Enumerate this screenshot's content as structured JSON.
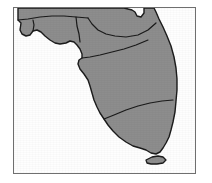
{
  "figure": {
    "background_color": "#ffffff",
    "frame": {
      "border_color": "#6f6f6f",
      "border_width_px": 1,
      "x": 13,
      "y": 7,
      "width": 183,
      "height": 167
    }
  },
  "map": {
    "land_fill_color": "#8d8d8d",
    "water_fill_color": "#ffffff",
    "outline_color": "#1a1a1a",
    "internal_border_color": "#1a1a1a",
    "outline_width_px": 1.4,
    "internal_border_width_px": 1.2,
    "regions": [
      {
        "id": "western-panhandle",
        "label": "Western Panhandle"
      },
      {
        "id": "central-panhandle",
        "label": "Central Panhandle"
      },
      {
        "id": "eastern-panhandle",
        "label": "Eastern Panhandle"
      },
      {
        "id": "north-central",
        "label": "North Central"
      },
      {
        "id": "northeast",
        "label": "Northeast"
      },
      {
        "id": "central-peninsula",
        "label": "Central Peninsula"
      },
      {
        "id": "south-peninsula",
        "label": "South Peninsula"
      },
      {
        "id": "southeast-tip",
        "label": "Southeast Tip"
      }
    ],
    "features": [
      {
        "id": "mainland",
        "label": "Florida mainland"
      },
      {
        "id": "florida-keys",
        "label": "Florida Keys"
      }
    ]
  },
  "chart_data": {
    "type": "map",
    "projection": "unspecified",
    "xlabel": "",
    "ylabel": "",
    "legend": [],
    "annotations": [],
    "shapes": [
      {
        "name": "mainland",
        "fill": "#8d8d8d",
        "stroke": "#1a1a1a",
        "path": "M 18,8 L 18,20 L 21,23 L 20,30 L 22,34 L 26,36 L 30,35 L 33,31 L 37,30 L 41,32 L 45,36 L 50,40 L 55,43 L 60,44 L 66,43 L 70,41 L 74,42 L 77,45 L 80,49 L 82,54 L 82,58 L 79,60 L 78,64 L 80,69 L 84,74 L 88,80 L 90,86 L 92,93 L 94,100 L 97,107 L 100,113 L 104,119 L 108,125 L 113,131 L 119,137 L 126,142 L 133,146 L 140,148 L 146,150 L 151,153 L 156,154 L 160,152 L 163,148 L 166,143 L 169,137 L 171,130 L 173,122 L 175,112 L 176,101 L 177,90 L 177,79 L 176,68 L 174,57 L 171,46 L 167,36 L 163,27 L 159,19 L 156,12 L 154,8 L 144,8 L 144,13 L 141,17 L 137,16 L 135,12 L 132,10 L 128,9 L 124,8 Z",
        "path_note": "Simplified outline of the Florida mainland, panhandle at top-left, peninsula extending to lower right."
      },
      {
        "name": "florida-keys",
        "fill": "#8d8d8d",
        "stroke": "#1a1a1a",
        "path": "M 146,160 L 152,157 L 158,156 L 163,157 L 166,160 L 163,163 L 157,164 L 151,164 L 147,163 Z",
        "path_note": "Small elongated island chain south-west of the mainland tip."
      }
    ],
    "internal_boundaries": [
      {
        "name": "panhandle-north-line",
        "path": "M 18,20 L 28,19 L 40,17 L 52,16 L 64,16 L 76,17 L 88,18"
      },
      {
        "name": "western-panhandle-divider",
        "path": "M 33,31 L 34,25 L 33,20"
      },
      {
        "name": "central-panhandle-divider",
        "path": "M 76,17 L 77,26 L 79,34 L 80,42"
      },
      {
        "name": "north-central-divider",
        "path": "M 88,18 L 92,24 L 98,30 L 106,34 L 115,36 L 126,37 L 138,35 L 148,30 L 156,23"
      },
      {
        "name": "central-peninsula-divider",
        "path": "M 82,58 L 90,57 L 100,55 L 112,52 L 124,49 L 136,45 L 148,40"
      },
      {
        "name": "south-peninsula-divider",
        "path": "M 104,119 L 114,115 L 126,110 L 138,106 L 150,103 L 162,101 L 173,100"
      }
    ]
  }
}
